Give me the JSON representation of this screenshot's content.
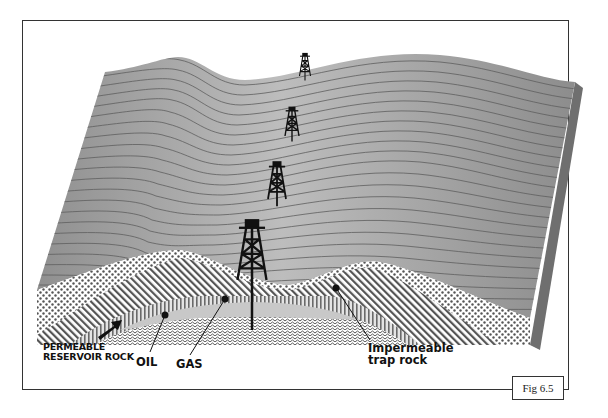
{
  "figure": {
    "caption": "Fig 6.5",
    "type": "block diagram of anticline oil trap",
    "surface": {
      "fill": "#a9a9a9",
      "strata_line_color": "#5e5e5e",
      "side_fill": "#6f6f6f"
    },
    "labels": {
      "permeable_line1": "PERMEABLE",
      "permeable_line2": "RESERVOIR ROCK",
      "oil": "OIL",
      "gas": "GAS",
      "impermeable_line1": "Impermeable",
      "impermeable_line2": "trap rock"
    },
    "derricks": [
      {
        "id": "derrick-1",
        "position": "far"
      },
      {
        "id": "derrick-2",
        "position": "mid-far"
      },
      {
        "id": "derrick-3",
        "position": "mid-near"
      },
      {
        "id": "derrick-4",
        "position": "near-drilling"
      }
    ],
    "layers": [
      {
        "name": "dotted-rock",
        "pattern": "dots"
      },
      {
        "name": "diagonal-hatch-rock",
        "pattern": "diagonal-lines"
      },
      {
        "name": "impermeable-trap-rock",
        "pattern": "vertical-lines"
      },
      {
        "name": "gas",
        "pattern": "solid-light-gray"
      },
      {
        "name": "oil",
        "pattern": "wavy-lines"
      }
    ]
  }
}
